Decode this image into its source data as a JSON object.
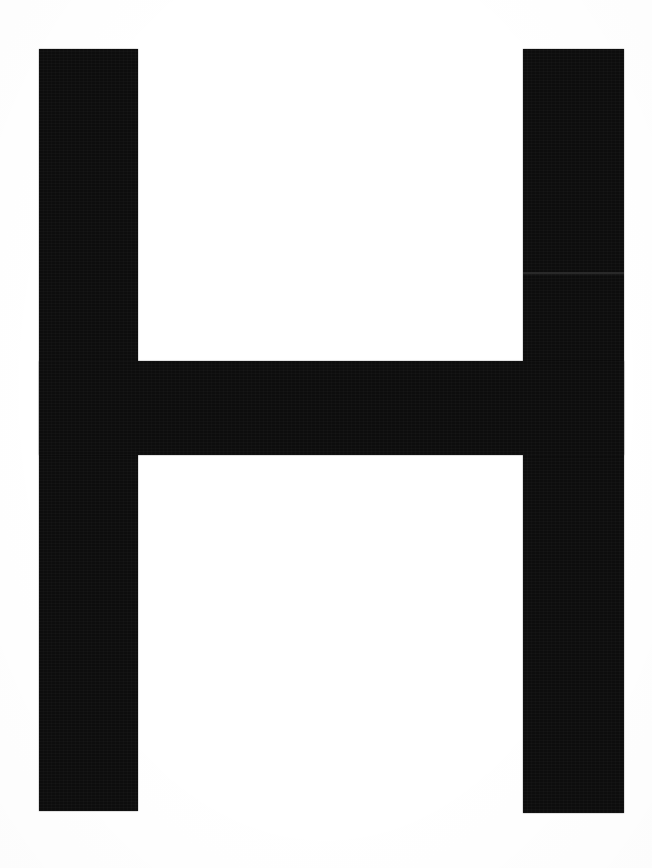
{
  "image": {
    "kind": "letterform-specimen",
    "title": "Letter H",
    "character": "H",
    "script": "Latin",
    "case": "uppercase",
    "style": "sans-serif grotesque, heavy weight",
    "background_color": "#ffffff",
    "ink_color": "#0d0d0d",
    "canvas": {
      "width": 652,
      "height": 868,
      "units": "px"
    }
  },
  "glyph": {
    "name": "capital-letter-h",
    "label": "H",
    "bounds": {
      "left": 39,
      "top": 49,
      "right": 624,
      "bottom": 811,
      "width": 585,
      "height": 762
    },
    "strokes": [
      {
        "name": "stem-left",
        "role": "left vertical stem",
        "left": 39,
        "top": 49,
        "width": 99,
        "height": 762,
        "color": "#0d0d0d"
      },
      {
        "name": "stem-right",
        "role": "right vertical stem",
        "left": 523,
        "top": 49,
        "width": 101,
        "height": 764,
        "color": "#0d0d0d"
      },
      {
        "name": "crossbar",
        "role": "horizontal crossbar",
        "left": 39,
        "top": 361,
        "width": 585,
        "height": 94,
        "color": "#0d0d0d"
      }
    ],
    "counters": [
      {
        "name": "counter-upper",
        "role": "upper open counter",
        "left": 138,
        "top": 49,
        "width": 385,
        "height": 312
      },
      {
        "name": "counter-lower",
        "role": "lower open counter",
        "left": 138,
        "top": 455,
        "width": 385,
        "height": 356
      }
    ]
  },
  "artifacts": {
    "scan_seam": {
      "name": "scan-seam-line",
      "description": "faint lighter horizontal seam crossing the right stem",
      "left": 523,
      "top": 272,
      "width": 101,
      "height": 2,
      "color": "#2e2e2e"
    }
  }
}
